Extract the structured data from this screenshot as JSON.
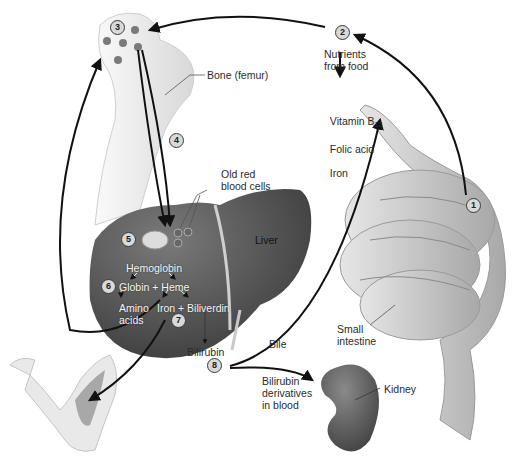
{
  "figure": {
    "steps": [
      {
        "id": "1",
        "label": "1"
      },
      {
        "id": "2",
        "label": "2"
      },
      {
        "id": "3",
        "label": "3"
      },
      {
        "id": "4",
        "label": "4"
      },
      {
        "id": "5",
        "label": "5"
      },
      {
        "id": "6",
        "label": "6"
      },
      {
        "id": "7",
        "label": "7"
      },
      {
        "id": "8",
        "label": "8"
      }
    ],
    "labels": {
      "bone": "Bone (femur)",
      "nutrients": "Nutrients\nfrom food",
      "vitamin_b": "Vitamin B",
      "vitamin_sub": "12",
      "folic_acid": "Folic acid",
      "iron_nutrient": "Iron",
      "old_rbc": "Old red\nblood cells",
      "liver": "Liver",
      "hemoglobin": "Hemoglobin",
      "globin_heme": "Globin + Heme",
      "amino_acids": "Amino\nacids",
      "iron_biliverdin": "Iron + Biliverdin",
      "bilirubin": "Bilirubin",
      "bile": "Bile",
      "small_intestine": "Small\nintestine",
      "bilirubin_derivatives": "Bilirubin\nderivatives\nin blood",
      "kidney": "Kidney"
    },
    "colors": {
      "arrow": "#111111",
      "liver": "#4a4a4a",
      "bone": "#ececec",
      "intestine": "#c8c8c8",
      "kidney": "#555555",
      "step_fill": "#d9d9d9"
    }
  }
}
